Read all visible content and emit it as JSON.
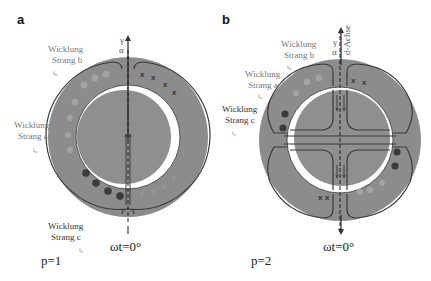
{
  "figure": {
    "panels": [
      {
        "id": "a",
        "letter": "a",
        "pole_pairs_label": "p=1",
        "angle_label": "ωt=0°",
        "axis_labels": {
          "gamma": "γ",
          "alpha": "α"
        },
        "windings": [
          {
            "name_line1": "Wicklung",
            "name_line2": "Strang b",
            "current": "i",
            "current_sub": "b"
          },
          {
            "name_line1": "Wicklung",
            "name_line2": "Strang a",
            "current": "i",
            "current_sub": "a"
          },
          {
            "name_line1": "Wicklung",
            "name_line2": "Strang c",
            "current": "i",
            "current_sub": "c"
          }
        ],
        "conductor_mark": "x"
      },
      {
        "id": "b",
        "letter": "b",
        "pole_pairs_label": "p=2",
        "angle_label": "ωt=0°",
        "axis_labels": {
          "gamma": "γ",
          "alpha": "α",
          "d_axis": "d-Achse"
        },
        "windings": [
          {
            "name_line1": "Wicklung",
            "name_line2": "Strang b",
            "current": "i",
            "current_sub": "b"
          },
          {
            "name_line1": "Wicklung",
            "name_line2": "Strang a",
            "current": "i",
            "current_sub": "a"
          },
          {
            "name_line1": "Wicklung",
            "name_line2": "Strang c",
            "current": "i",
            "current_sub": "c"
          }
        ],
        "conductor_mark": "x"
      }
    ],
    "colors": {
      "stator": "#8c8c8c",
      "rotor": "#8f8f8f",
      "airgap": "#ffffff",
      "field_line": "#3a3a3a",
      "conductor_dark": "#3b3b3b",
      "conductor_light": "#a0a0a0"
    }
  }
}
